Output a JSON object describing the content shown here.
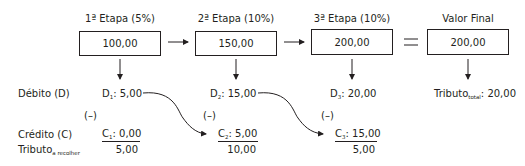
{
  "stages": [
    {
      "title": "1ª Etapa (5%)",
      "value": "100,00",
      "debit_label": "D",
      "debit_sub": "1",
      "debit_value": ": 5,00",
      "credit_label": "C",
      "credit_sub": "1",
      "credit_value": ": 0,00",
      "minus": "(–)",
      "result": "5,00"
    },
    {
      "title": "2ª Etapa (10%)",
      "value": "150,00",
      "debit_label": "D",
      "debit_sub": "2",
      "debit_value": ": 15,00",
      "credit_label": "C",
      "credit_sub": "2",
      "credit_value": ": 5,00",
      "minus": "(–)",
      "result": "10,00"
    },
    {
      "title": "3ª Etapa (10%)",
      "value": "200,00",
      "debit_label": "D",
      "debit_sub": "3",
      "debit_value": ": 20,00",
      "credit_label": "C",
      "credit_sub": "3",
      "credit_value": ": 15,00",
      "minus": "(–)",
      "result": "5,00"
    }
  ],
  "final": {
    "title": "Valor Final",
    "value": "200,00",
    "tributo_label": "Tributo",
    "tributo_sub": "total",
    "tributo_value": ": 20,00"
  },
  "equals_sign": "=",
  "row_labels": {
    "debit": "Débito (D)",
    "credit": "Crédito (C)",
    "tributo": "Tributo",
    "tributo_sub": "a recolher"
  }
}
